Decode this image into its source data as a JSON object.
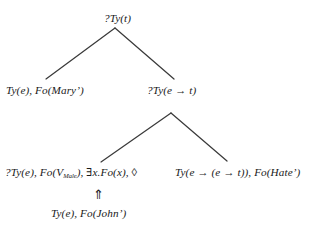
{
  "diagram": {
    "type": "dynamic-syntax-semantic-tree",
    "nodes": [
      {
        "id": "root",
        "label": "?Ty(t)",
        "role": "root-requirement-node"
      },
      {
        "id": "mary",
        "label": "Ty(e), Fo(Mary’)",
        "role": "left-daughter-argument-node"
      },
      {
        "id": "et",
        "label": "?Ty(e → t)",
        "role": "right-daughter-functor-requirement-node"
      },
      {
        "id": "vmale_prefix",
        "label": "?Ty(e), Fo(V",
        "subscript": "Male",
        "label_suffix": "), ∃x.Fo(x), ◊",
        "role": "metavariable-node"
      },
      {
        "id": "hate",
        "label": "Ty(e → (e → t)), Fo(Hate’)",
        "role": "predicate-node"
      },
      {
        "id": "john",
        "label": "Ty(e), Fo(John’)",
        "role": "unfixed-node-substitution-source"
      }
    ],
    "annotations": [
      {
        "id": "double-up-arrow",
        "glyph": "⇑",
        "name": "double-up-arrow",
        "meaning": "substitution-merge-upward"
      }
    ],
    "edges": [
      {
        "from": "root",
        "to": "mary",
        "kind": "tree-branch-left"
      },
      {
        "from": "root",
        "to": "et",
        "kind": "tree-branch-right"
      },
      {
        "from": "et",
        "to": "vmale_prefix",
        "kind": "tree-branch-left"
      },
      {
        "from": "et",
        "to": "hate",
        "kind": "tree-branch-right"
      }
    ],
    "style": {
      "edge_color": "#3a3a3a",
      "text_color": "#1a1a1a",
      "background": "#ffffff"
    }
  }
}
